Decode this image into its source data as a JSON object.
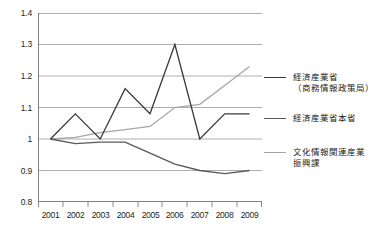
{
  "chart_data": {
    "type": "line",
    "title": "",
    "xlabel": "",
    "ylabel": "",
    "categories": [
      "2001",
      "2002",
      "2003",
      "2004",
      "2005",
      "2006",
      "2007",
      "2008",
      "2009"
    ],
    "ylim": [
      0.8,
      1.4
    ],
    "yticks": [
      "0.8",
      "0.9",
      "1",
      "1.1",
      "1.2",
      "1.3",
      "1.4"
    ],
    "ytick_values": [
      0.8,
      0.9,
      1.0,
      1.1,
      1.2,
      1.3,
      1.4
    ],
    "grid": true,
    "legend_position": "right",
    "series": [
      {
        "name": "経済産業省\n（商務情報政策局）",
        "name_line1": "経済産業省",
        "name_line2": "（商務情報政策局）",
        "color": "#3a3a3a",
        "values": [
          1.0,
          1.08,
          1.0,
          1.16,
          1.08,
          1.3,
          1.0,
          1.08,
          1.08
        ]
      },
      {
        "name": "経済産業省本省",
        "name_line1": "経済産業省本省",
        "name_line2": "",
        "color": "#595959",
        "values": [
          1.0,
          0.985,
          0.99,
          0.99,
          0.955,
          0.92,
          0.9,
          0.89,
          0.9
        ]
      },
      {
        "name": "文化情報関連産業\n振興課",
        "name_line1": "文化情報関連産業",
        "name_line2": "振興課",
        "color": "#a6a6a6",
        "values": [
          1.0,
          1.005,
          1.02,
          1.03,
          1.04,
          1.1,
          1.11,
          1.17,
          1.23
        ]
      }
    ]
  },
  "axes": {
    "y_tick_labels": [
      "1.4",
      "1.3",
      "1.2",
      "1.1",
      "1",
      "0.9",
      "0.8"
    ],
    "x_tick_labels": [
      "2001",
      "2002",
      "2003",
      "2004",
      "2005",
      "2006",
      "2007",
      "2008",
      "2009"
    ]
  },
  "legend": {
    "items": [
      {
        "line1": "経済産業省",
        "line2": "（商務情報政策局）",
        "color": "#3a3a3a"
      },
      {
        "line1": "経済産業省本省",
        "line2": "",
        "color": "#595959"
      },
      {
        "line1": "文化情報関連産業",
        "line2": "振興課",
        "color": "#a6a6a6"
      }
    ]
  },
  "colors": {
    "grid": "#9a9a9a",
    "axis": "#808080",
    "text": "#231f20",
    "background": "#ffffff"
  }
}
